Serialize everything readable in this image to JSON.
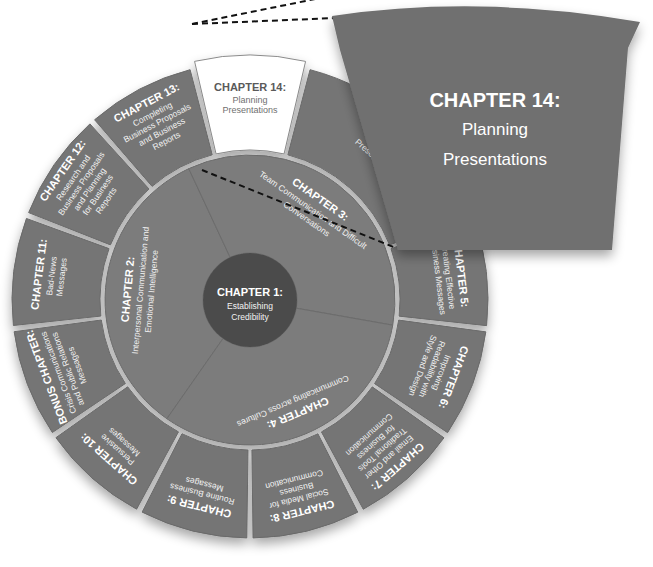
{
  "diagram": {
    "center": {
      "heading": "CHAPTER 1:",
      "lines": [
        "Establishing",
        "Credibility"
      ]
    },
    "middle_ring": [
      {
        "heading": "CHAPTER 2:",
        "lines": [
          "Interpersonal Communication and",
          "Emotional Intelligence"
        ]
      },
      {
        "heading": "CHAPTER 3:",
        "lines": [
          "Team Communication and Difficult",
          "Conversations"
        ]
      },
      {
        "heading": "CHAPTER 4:",
        "lines": [
          "Communicating across Cultures"
        ]
      }
    ],
    "outer_ring": [
      {
        "heading": "CHAPTER 5:",
        "lines": [
          "Creating Effective",
          "Business Messages"
        ]
      },
      {
        "heading": "CHAPTER 6:",
        "lines": [
          "Improving",
          "Readability with",
          "Style and Design"
        ]
      },
      {
        "heading": "CHAPTER 7:",
        "lines": [
          "Email and Other",
          "Traditional Tools",
          "for Business",
          "Communication"
        ]
      },
      {
        "heading": "CHAPTER 8:",
        "lines": [
          "Social Media for",
          "Business",
          "Communication"
        ]
      },
      {
        "heading": "CHAPTER 9:",
        "lines": [
          "Routine Business",
          "Messages"
        ]
      },
      {
        "heading": "CHAPTER 10:",
        "lines": [
          "Persuasive",
          "Messages"
        ]
      },
      {
        "heading": "BONUS CHAPTER:",
        "lines": [
          "Crisis Communications",
          "and Public Relations",
          "Messages"
        ]
      },
      {
        "heading": "CHAPTER 11:",
        "lines": [
          "Bad-News",
          "Messages"
        ]
      },
      {
        "heading": "CHAPTER 12:",
        "lines": [
          "Research and",
          "Business Proposals",
          "and Planning",
          "for Business",
          "Reports"
        ]
      },
      {
        "heading": "CHAPTER 13:",
        "lines": [
          "Completing",
          "Business Proposals",
          "and Business",
          "Reports"
        ]
      },
      {
        "heading": "CHAPTER 14:",
        "lines": [
          "Planning",
          "Presentations"
        ],
        "highlighted": true
      },
      {
        "heading": "CHAPTER 15:",
        "lines": [
          "Delivering",
          "Presentations"
        ]
      }
    ],
    "callout": {
      "heading": "CHAPTER 14:",
      "lines": [
        "Planning",
        "Presentations"
      ]
    },
    "colors": {
      "outer_segment": "#747474",
      "middle_segment": "#7b7b7b",
      "core": "#4c4c4c",
      "highlight": "#ffffff",
      "callout": "#707070"
    }
  }
}
